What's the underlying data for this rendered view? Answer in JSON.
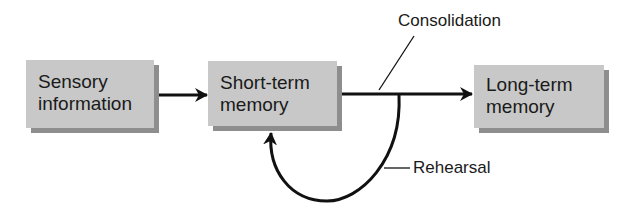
{
  "diagram": {
    "nodes": [
      {
        "id": "sensory",
        "line1": "Sensory",
        "line2": "information"
      },
      {
        "id": "short_term",
        "line1": "Short-term",
        "line2": "memory"
      },
      {
        "id": "long_term",
        "line1": "Long-term",
        "line2": "memory"
      }
    ],
    "edges": [
      {
        "from": "sensory",
        "to": "short_term"
      },
      {
        "from": "short_term",
        "to": "long_term",
        "label": "Consolidation"
      },
      {
        "from": "short_term",
        "to": "short_term",
        "label": "Rehearsal"
      }
    ],
    "labels": {
      "consolidation": "Consolidation",
      "rehearsal": "Rehearsal"
    },
    "colors": {
      "box_fill": "#c8c8c8",
      "box_shadow": "#8e8e8e",
      "line": "#111111"
    }
  }
}
